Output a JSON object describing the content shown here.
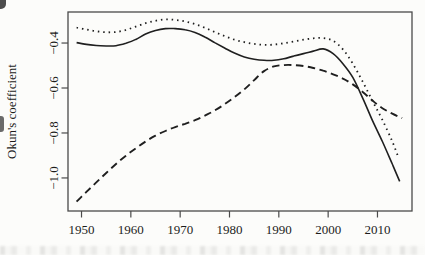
{
  "figure": {
    "background_color": "#fcfcfa",
    "frame_color": "#4a4a4a",
    "line_color": "#1f1f1f"
  },
  "chart_data": {
    "type": "line",
    "title": "",
    "xlabel": "",
    "ylabel": "Okun's coefficient",
    "grid": false,
    "legend": "none",
    "xlim": [
      1947.26,
      2017.0
    ],
    "ylim": [
      -1.147,
      -0.262
    ],
    "x_ticks": [
      1950,
      1960,
      1970,
      1980,
      1990,
      2000,
      2010
    ],
    "x_tick_labels": [
      "1950",
      "1960",
      "1970",
      "1980",
      "1990",
      "2000",
      "2010"
    ],
    "y_ticks": [
      -0.4,
      -0.6,
      -0.8,
      -1.0
    ],
    "y_tick_labels": [
      "−0.4",
      "−0.6",
      "−0.8",
      "−1.0"
    ],
    "series": [
      {
        "name": "solid",
        "style": "solid",
        "points": [
          [
            1949,
            -0.398
          ],
          [
            1951,
            -0.406
          ],
          [
            1953,
            -0.411
          ],
          [
            1955,
            -0.413
          ],
          [
            1957,
            -0.412
          ],
          [
            1959,
            -0.401
          ],
          [
            1961,
            -0.384
          ],
          [
            1963,
            -0.36
          ],
          [
            1965,
            -0.344
          ],
          [
            1967,
            -0.336
          ],
          [
            1969,
            -0.336
          ],
          [
            1971,
            -0.341
          ],
          [
            1973,
            -0.353
          ],
          [
            1975,
            -0.373
          ],
          [
            1977,
            -0.398
          ],
          [
            1979,
            -0.422
          ],
          [
            1981,
            -0.445
          ],
          [
            1983,
            -0.462
          ],
          [
            1985,
            -0.472
          ],
          [
            1987,
            -0.477
          ],
          [
            1989,
            -0.477
          ],
          [
            1991,
            -0.47
          ],
          [
            1993,
            -0.458
          ],
          [
            1995,
            -0.447
          ],
          [
            1997,
            -0.436
          ],
          [
            1999,
            -0.426
          ],
          [
            2001,
            -0.447
          ],
          [
            2003,
            -0.492
          ],
          [
            2005,
            -0.553
          ],
          [
            2007,
            -0.645
          ],
          [
            2009,
            -0.745
          ],
          [
            2011,
            -0.838
          ],
          [
            2013,
            -0.938
          ],
          [
            2014.5,
            -1.015
          ]
        ]
      },
      {
        "name": "dotted",
        "style": "dotted",
        "points": [
          [
            1949,
            -0.331
          ],
          [
            1951,
            -0.34
          ],
          [
            1953,
            -0.348
          ],
          [
            1955,
            -0.352
          ],
          [
            1957,
            -0.351
          ],
          [
            1959,
            -0.342
          ],
          [
            1961,
            -0.327
          ],
          [
            1963,
            -0.312
          ],
          [
            1965,
            -0.301
          ],
          [
            1967,
            -0.295
          ],
          [
            1969,
            -0.297
          ],
          [
            1971,
            -0.304
          ],
          [
            1973,
            -0.316
          ],
          [
            1975,
            -0.332
          ],
          [
            1977,
            -0.351
          ],
          [
            1979,
            -0.369
          ],
          [
            1981,
            -0.385
          ],
          [
            1983,
            -0.396
          ],
          [
            1985,
            -0.404
          ],
          [
            1987,
            -0.408
          ],
          [
            1989,
            -0.407
          ],
          [
            1991,
            -0.401
          ],
          [
            1993,
            -0.393
          ],
          [
            1995,
            -0.385
          ],
          [
            1997,
            -0.379
          ],
          [
            1999,
            -0.378
          ],
          [
            2001,
            -0.39
          ],
          [
            2003,
            -0.428
          ],
          [
            2005,
            -0.492
          ],
          [
            2007,
            -0.572
          ],
          [
            2009,
            -0.658
          ],
          [
            2011,
            -0.742
          ],
          [
            2013,
            -0.838
          ],
          [
            2014.3,
            -0.912
          ]
        ]
      },
      {
        "name": "dashed",
        "style": "dashed",
        "points": [
          [
            1949,
            -1.105
          ],
          [
            1951,
            -1.062
          ],
          [
            1953,
            -1.02
          ],
          [
            1955,
            -0.978
          ],
          [
            1957,
            -0.938
          ],
          [
            1959,
            -0.901
          ],
          [
            1961,
            -0.868
          ],
          [
            1963,
            -0.838
          ],
          [
            1965,
            -0.812
          ],
          [
            1967,
            -0.791
          ],
          [
            1969,
            -0.774
          ],
          [
            1971,
            -0.759
          ],
          [
            1973,
            -0.743
          ],
          [
            1975,
            -0.723
          ],
          [
            1977,
            -0.7
          ],
          [
            1979,
            -0.672
          ],
          [
            1981,
            -0.641
          ],
          [
            1983,
            -0.606
          ],
          [
            1985,
            -0.565
          ],
          [
            1987,
            -0.525
          ],
          [
            1989,
            -0.504
          ],
          [
            1991,
            -0.498
          ],
          [
            1993,
            -0.498
          ],
          [
            1995,
            -0.502
          ],
          [
            1997,
            -0.511
          ],
          [
            1999,
            -0.523
          ],
          [
            2001,
            -0.539
          ],
          [
            2003,
            -0.558
          ],
          [
            2005,
            -0.584
          ],
          [
            2007,
            -0.618
          ],
          [
            2009,
            -0.656
          ],
          [
            2011,
            -0.69
          ],
          [
            2013,
            -0.714
          ],
          [
            2015,
            -0.734
          ]
        ]
      }
    ]
  }
}
